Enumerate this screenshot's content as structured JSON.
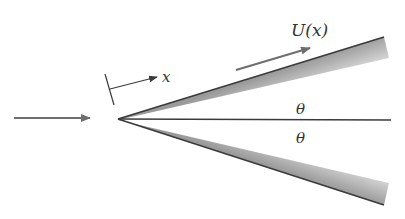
{
  "diagram": {
    "labels": {
      "velocity": "U(x)",
      "coordinate": "x",
      "angle_upper": "θ",
      "angle_lower": "θ"
    },
    "colors": {
      "line": "#3a3a3a",
      "arrow": "#6e6e6e",
      "shade_dark": "#9a9a9a",
      "shade_light": "#f2f2f2",
      "background": "#ffffff"
    },
    "icons": {
      "incoming_flow": "arrow-right-icon",
      "surface_flow": "arrow-up-right-icon",
      "coordinate_axis": "arrow-right-icon"
    }
  }
}
